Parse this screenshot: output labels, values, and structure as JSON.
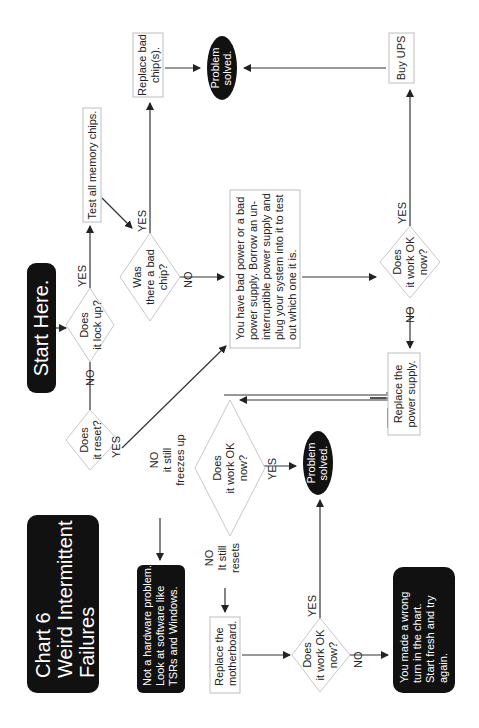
{
  "title": {
    "line1": "Chart 6",
    "line2": "Weird Intermittent",
    "line3": "Failures"
  },
  "start": {
    "label": "Start Here."
  },
  "nodes": {
    "lock_up": {
      "l1": "Does",
      "l2": "it lock up?"
    },
    "reset": {
      "l1": "Does",
      "l2": "it reset?"
    },
    "test_chips": {
      "label": "Test all memory chips."
    },
    "bad_chip": {
      "l1": "Was",
      "l2": "there a bad",
      "l3": "chip?"
    },
    "replace_chips": {
      "l1": "Replace bad",
      "l2": "chip(s)."
    },
    "solved_top": {
      "l1": "Problem",
      "l2": "solved."
    },
    "bad_power": {
      "l1": "You have bad power or a bad",
      "l2": "power supply. Borrow an un-",
      "l3": "interruptible power supply and",
      "l4": "plug your system into it to test",
      "l5": "out which one it is."
    },
    "buy_ups": {
      "label": "Buy UPS"
    },
    "work_ok_right": {
      "l1": "Does",
      "l2": "it work OK",
      "l3": "now?"
    },
    "replace_psu": {
      "l1": "Replace the",
      "l2": "power supply."
    },
    "work_ok_mid": {
      "l1": "Does",
      "l2": "it work OK",
      "l3": "now?"
    },
    "solved_mid": {
      "l1": "Problem",
      "l2": "solved."
    },
    "not_hardware": {
      "l1": "Not a hardware problem.",
      "l2": "Look at software like",
      "l3": "TSRs and Windows."
    },
    "replace_mb": {
      "l1": "Replace the",
      "l2": "motherboard."
    },
    "work_ok_bottom": {
      "l1": "Does",
      "l2": "it work OK",
      "l3": "now?"
    },
    "wrong_turn": {
      "l1": "You made a wrong",
      "l2": "turn in the chart.",
      "l3": "Start fresh and try",
      "l4": "again."
    }
  },
  "edge_labels": {
    "lock_yes": "YES",
    "lock_no": "NO",
    "reset_yes": "YES",
    "chip_yes": "YES",
    "chip_no": "NO",
    "right_yes": "YES",
    "right_no": "NO",
    "mid_yes": "YES",
    "mid_no_freeze_1": "NO",
    "mid_no_freeze_2": "it still",
    "mid_no_freeze_3": "freezes up",
    "mid_no_reset_1": "NO",
    "mid_no_reset_2": "It still",
    "mid_no_reset_3": "resets",
    "bottom_yes": "YES",
    "bottom_no": "NO"
  },
  "colors": {
    "dark_fill": "#111111",
    "box_border": "#bdbdbd",
    "line": "#333333"
  }
}
